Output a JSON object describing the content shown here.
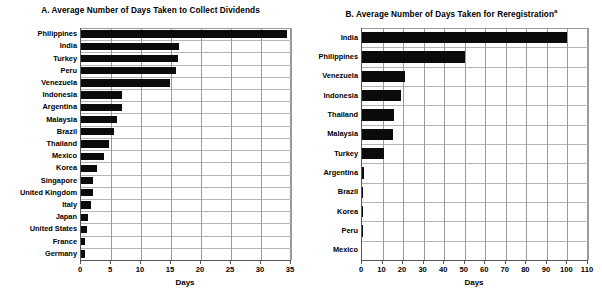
{
  "chart_data": [
    {
      "type": "bar",
      "orientation": "horizontal",
      "panel": "A",
      "title": "A. Average Number of Days Taken to Collect Dividends",
      "title_prefix": "A.",
      "xlabel": "Days",
      "ylabel": "",
      "xlim": [
        0,
        35
      ],
      "xticks": [
        0,
        5,
        10,
        15,
        20,
        25,
        30,
        35
      ],
      "grid": true,
      "grid_axis": "both",
      "legend": "none",
      "bar_color": "#0b0b0b",
      "categories": [
        "Philippines",
        "India",
        "Turkey",
        "Peru",
        "Venezuela",
        "Indonesia",
        "Argentina",
        "Malaysia",
        "Brazil",
        "Thailand",
        "Mexico",
        "Korea",
        "Singapore",
        "United Kingdom",
        "Italy",
        "Japan",
        "United States",
        "France",
        "Germany"
      ],
      "values": [
        34.3,
        16.4,
        16.1,
        15.8,
        14.9,
        6.9,
        6.8,
        6.0,
        5.5,
        4.6,
        3.8,
        2.7,
        2.0,
        2.0,
        1.7,
        1.1,
        1.0,
        0.7,
        0.7
      ]
    },
    {
      "type": "bar",
      "orientation": "horizontal",
      "panel": "B",
      "title": "B. Average Number of Days Taken for Reregistration",
      "title_prefix": "B.",
      "title_superscript": "a",
      "xlabel": "Days",
      "ylabel": "",
      "xlim": [
        0,
        110
      ],
      "xticks": [
        0,
        10,
        20,
        30,
        40,
        50,
        60,
        70,
        80,
        90,
        100,
        110
      ],
      "grid": true,
      "grid_axis": "both",
      "legend": "none",
      "bar_color": "#0b0b0b",
      "categories": [
        "India",
        "Philippines",
        "Venezuela",
        "Indonesia",
        "Thailand",
        "Malaysia",
        "Turkey",
        "Argentina",
        "Brazil",
        "Korea",
        "Peru",
        "Mexico"
      ],
      "values": [
        100,
        50,
        21,
        19,
        15.6,
        15,
        10.7,
        1.1,
        0.7,
        0.35,
        0.2,
        0
      ]
    }
  ]
}
